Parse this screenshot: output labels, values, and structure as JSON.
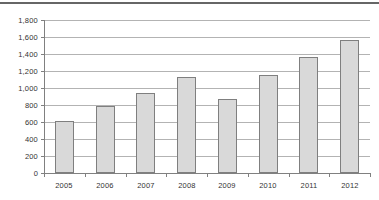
{
  "colors": {
    "background": "#ffffff",
    "top_rule": "#666666",
    "bar_fill": "#d9d9d9",
    "bar_border": "#7f7f7f",
    "gridline": "#b3b3b3",
    "axis": "#808080",
    "text": "#333333"
  },
  "chart_data": {
    "type": "bar",
    "title": "",
    "xlabel": "",
    "ylabel": "",
    "categories": [
      "2005",
      "2006",
      "2007",
      "2008",
      "2009",
      "2010",
      "2011",
      "2012"
    ],
    "values": [
      610,
      790,
      940,
      1130,
      870,
      1150,
      1360,
      1560
    ],
    "ylim": [
      0,
      1800
    ],
    "ytick_step": 200,
    "ytick_labels": [
      "0",
      "200",
      "400",
      "600",
      "800",
      "1,000",
      "1,200",
      "1,400",
      "1,600",
      "1,800"
    ],
    "grid": true,
    "legend_position": "none"
  }
}
